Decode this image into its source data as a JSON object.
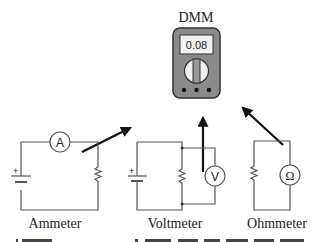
{
  "dmm": {
    "title": "DMM",
    "display_value": "0.08",
    "body_color": "#8a8a8a",
    "display_color": "#f2f2f2",
    "dial_color": "#f0f0f0",
    "dial_bar_color": "#9a9a9a"
  },
  "circuits": [
    {
      "name": "Ammeter",
      "meter_symbol": "A"
    },
    {
      "name": "Voltmeter",
      "meter_symbol": "V"
    },
    {
      "name": "Ohmmeter",
      "meter_symbol": "Ω"
    }
  ],
  "battery_plus": "+",
  "caption_partial": "(b) DMM ... (cut off caption text)"
}
